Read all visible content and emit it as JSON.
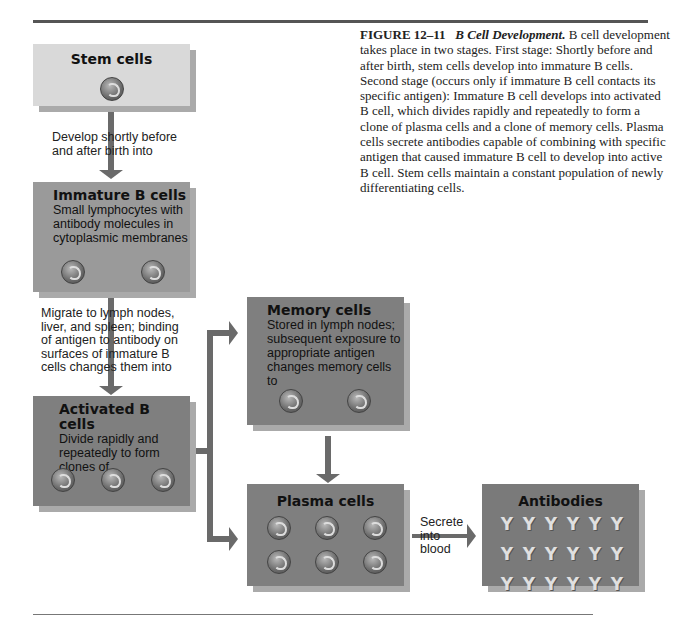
{
  "caption": {
    "figure_number": "FIGURE 12–11",
    "title": "B Cell Development.",
    "body": "B cell development takes place in two stages. First stage: Shortly before and after birth, stem cells develop into immature B cells. Second stage (occurs only if immature B cell contacts its specific antigen): Immature B cell develops into activated B cell, which divides rapidly and repeatedly to form a clone of plasma cells and a clone of memory cells. Plasma cells secrete antibodies capable of combining with specific antigen that caused immature B cell to develop into active B cell. Stem cells maintain a constant population of newly differentiating cells."
  },
  "nodes": {
    "stem": {
      "title": "Stem cells",
      "description": ""
    },
    "immature": {
      "title": "Immature B cells",
      "description": "Small lymphocytes with antibody molecules in cytoplasmic membranes"
    },
    "activated": {
      "title": "Activated B cells",
      "description": "Divide rapidly and repeatedly to form clones of"
    },
    "memory": {
      "title": "Memory cells",
      "description": "Stored in lymph nodes; subsequent exposure to appropriate antigen changes memory cells to"
    },
    "plasma": {
      "title": "Plasma cells",
      "description": ""
    },
    "antibodies": {
      "title": "Antibodies",
      "description": ""
    }
  },
  "edges": {
    "stem_to_immature": "Develop shortly before and after birth into",
    "immature_to_activated": "Migrate to lymph nodes, liver, and spleen; binding of antigen to antibody on surfaces of immature B cells changes them into",
    "plasma_to_antibodies": "Secrete into blood"
  },
  "colors": {
    "stem_box": "#d9d9d9",
    "immature_box": "#9a9a9a",
    "dark_box": "#7f7f7f",
    "arrow": "#6a6a6a"
  },
  "antibody_symbol": "Y"
}
